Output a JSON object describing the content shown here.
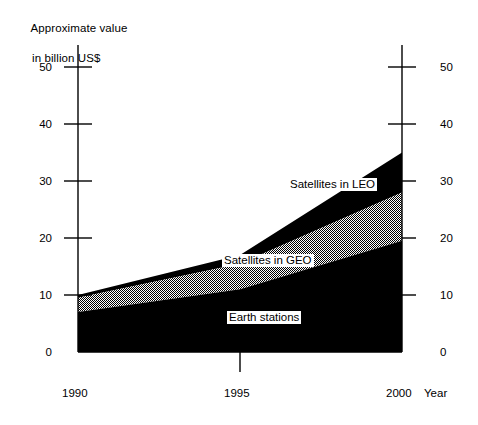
{
  "chart_data": {
    "type": "area",
    "title": "Approximate value in billion US$",
    "title_line1": "Approximate value",
    "title_line2": "in billion US$",
    "xlabel": "Year",
    "ylabel": "Approximate value in billion US$",
    "stacked": true,
    "x": [
      1990,
      1995,
      2000
    ],
    "categories": [
      "1990",
      "1995",
      "2000"
    ],
    "xtick_labels": [
      "1990",
      "1995",
      "2000"
    ],
    "ytick_labels": [
      "0",
      "10",
      "20",
      "30",
      "40",
      "50"
    ],
    "yticks": [
      0,
      10,
      20,
      30,
      40,
      50
    ],
    "ylim": [
      0,
      55
    ],
    "xlim": [
      1990,
      2000
    ],
    "grid": false,
    "legend_position": "in-plot-labels",
    "axes": {
      "left_axis": true,
      "right_axis": true,
      "left_tick_labels": [
        "50",
        "40",
        "30",
        "20",
        "10",
        "0"
      ],
      "right_tick_labels": [
        "50",
        "40",
        "30",
        "20",
        "10",
        "0"
      ]
    },
    "series": [
      {
        "name": "Earth stations",
        "label": "Earth stations",
        "color": "#000000",
        "fill": "solid-black",
        "values": [
          7,
          11,
          19.5
        ],
        "cumulative_top": [
          7,
          11,
          19.5
        ]
      },
      {
        "name": "Satellites in GEO",
        "label": "Satellites in GEO",
        "color": "#808080",
        "fill": "gray-stipple",
        "values": [
          2.5,
          4.5,
          8.5
        ],
        "cumulative_top": [
          9.5,
          15.5,
          28
        ]
      },
      {
        "name": "Satellites in LEO",
        "label": "Satellites in LEO",
        "color": "#000000",
        "fill": "solid-black",
        "values": [
          0.5,
          1.5,
          7
        ],
        "cumulative_top": [
          10,
          17,
          35
        ]
      }
    ]
  },
  "labels": {
    "leo": "Satellites in LEO",
    "geo": "Satellites in GEO",
    "earth": "Earth stations",
    "year": "Year"
  },
  "yticks": {
    "t50": "50",
    "t40": "40",
    "t30": "30",
    "t20": "20",
    "t10": "10",
    "t0": "0"
  },
  "yticks_right": {
    "t50": "50",
    "t40": "40",
    "t30": "30",
    "t20": "20",
    "t10": "10",
    "t0": "0"
  },
  "xticks": {
    "x1990": "1990",
    "x1995": "1995",
    "x2000": "2000"
  }
}
